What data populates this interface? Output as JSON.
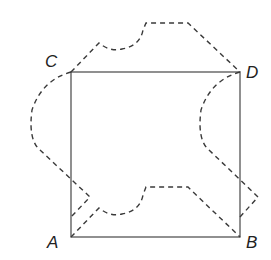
{
  "diagram": {
    "type": "geometry",
    "colors": {
      "square": "#555555",
      "dashed": "#3a3a3a",
      "label": "#222222",
      "background": "#ffffff"
    },
    "vertices": {
      "A": {
        "label": "A",
        "x": 71,
        "y": 237
      },
      "B": {
        "label": "B",
        "x": 240,
        "y": 237
      },
      "C": {
        "label": "C",
        "x": 71,
        "y": 72
      },
      "D": {
        "label": "D",
        "x": 240,
        "y": 72
      }
    },
    "labels": {
      "A": "A",
      "B": "B",
      "C": "C",
      "D": "D"
    },
    "dashed_shapes": [
      {
        "name": "top-shape",
        "attached_side": "CD"
      },
      {
        "name": "bottom-shape",
        "attached_side": "AB"
      },
      {
        "name": "left-shape",
        "attached_side": "CA"
      },
      {
        "name": "right-shape",
        "attached_side": "DB"
      }
    ]
  }
}
